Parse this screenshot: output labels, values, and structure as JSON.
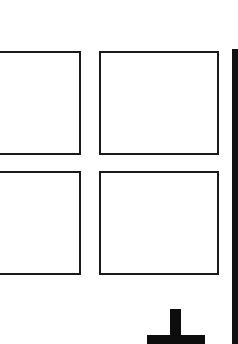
{
  "grid": {
    "tiles": [
      {
        "label": ""
      },
      {
        "label": ""
      },
      {
        "label": ""
      },
      {
        "label": ""
      }
    ]
  },
  "icons": {
    "add": "plus-icon"
  },
  "colors": {
    "background": "#ffffff",
    "stroke": "#1a1a1a",
    "side_bar": "#111111"
  }
}
